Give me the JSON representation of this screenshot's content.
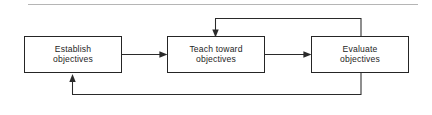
{
  "diagram": {
    "type": "flowchart-cycle",
    "background_color": "#ffffff",
    "line_color": "#2a2a2a",
    "box_border_color": "#252525",
    "text_color": "#1e1e1e",
    "top_rule_color": "#b5b5b5",
    "nodes": [
      {
        "id": "establish",
        "line1": "Establish",
        "line2": "objectives"
      },
      {
        "id": "teach",
        "line1": "Teach toward",
        "line2": "objectives"
      },
      {
        "id": "evaluate",
        "line1": "Evaluate",
        "line2": "objectives"
      }
    ],
    "connectors": [
      {
        "id": "establish-to-teach",
        "from": "establish",
        "to": "teach",
        "style": "straight-horizontal",
        "direction": "right"
      },
      {
        "id": "teach-to-evaluate",
        "from": "teach",
        "to": "evaluate",
        "style": "straight-horizontal",
        "direction": "right"
      },
      {
        "id": "evaluate-to-teach-feedback",
        "from": "evaluate",
        "to": "teach",
        "style": "elbow-over-top",
        "direction": "down-into-top"
      },
      {
        "id": "evaluate-to-establish-feedback",
        "from": "evaluate",
        "to": "establish",
        "style": "elbow-under-bottom",
        "direction": "up-into-bottom"
      }
    ]
  }
}
